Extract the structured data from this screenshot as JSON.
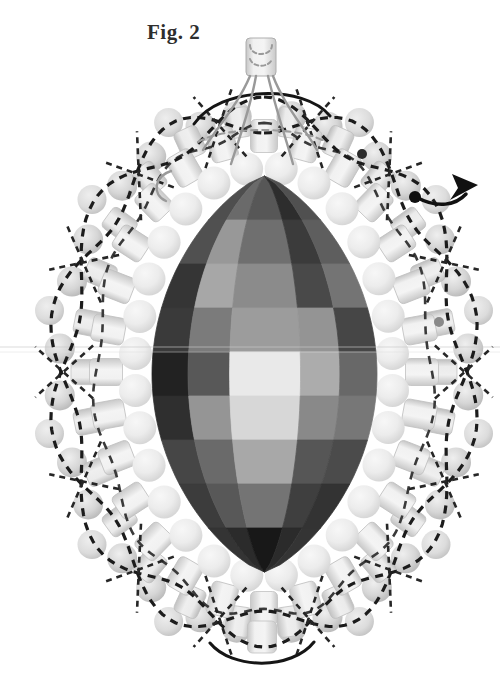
{
  "figure": {
    "label": "Fig. 2"
  },
  "colors": {
    "background": "#ffffff",
    "thread_dark": "#1c1c1c",
    "thread_mid": "#3a3a3a",
    "thread_gray": "#9a9a9a",
    "label_text": "#2e2e2e"
  },
  "diagram": {
    "canvas": {
      "width": 500,
      "height": 678
    },
    "center": {
      "x": 264,
      "y": 372
    },
    "central_bead": {
      "cx": 264.5,
      "cy": 374,
      "rx": 112.5,
      "ry": 198,
      "pointiness": 0.75,
      "col_fractions": [
        -1,
        -0.68,
        -0.31,
        0.32,
        0.67,
        1
      ],
      "row_bounds": [
        176,
        220,
        264,
        308,
        352,
        396,
        440,
        484,
        528,
        572
      ],
      "facet_colors": [
        [
          "#4e4e4e",
          "#6a6a6a",
          "#575757",
          "#2d2d2d",
          "#505050"
        ],
        [
          "#505050",
          "#989898",
          "#6f6f6f",
          "#3b3b3b",
          "#5e5e5e"
        ],
        [
          "#353535",
          "#a7a7a7",
          "#8b8b8b",
          "#494949",
          "#747474"
        ],
        [
          "#3a3a3a",
          "#7b7b7b",
          "#9c9c9c",
          "#949494",
          "#464646"
        ],
        [
          "#222222",
          "#585858",
          "#e9e9e9",
          "#acacac",
          "#686868"
        ],
        [
          "#2f2f2f",
          "#959595",
          "#d7d7d7",
          "#898989",
          "#777777"
        ],
        [
          "#464646",
          "#6a6a6a",
          "#a8a8a8",
          "#565656",
          "#4b4b4b"
        ],
        [
          "#3c3c3c",
          "#585858",
          "#747474",
          "#3f3f3f",
          "#333333"
        ],
        [
          "#343434",
          "#2b2b2b",
          "#181818",
          "#2b2b2b",
          "#343434"
        ]
      ]
    },
    "rings": [
      {
        "name": "picot-bead",
        "type": "round",
        "rx": 205,
        "ry": 258,
        "scale": 1.073,
        "count": 14,
        "phase": 0,
        "r": 14.5,
        "skip": [
          0,
          7
        ],
        "grad": "gradPicot",
        "adjust": 0
      },
      {
        "name": "edge-pair-bead",
        "type": "round-pair",
        "rx": 205,
        "ry": 258,
        "scale": 1.0,
        "count": 14,
        "phase": 12.857,
        "pair_dtheta": 5.2,
        "r": 15,
        "grad": "gradEdge",
        "adjust": 0
      },
      {
        "name": "outer-cylinder-bead",
        "type": "cylinder",
        "rx": 178,
        "ry": 252,
        "scale": 1.0,
        "count": 26,
        "phase": 6.9,
        "w": 25,
        "h": 30,
        "grad": "gradCylB",
        "adjust": 5.7
      },
      {
        "name": "cylinder-bead",
        "type": "cylinder",
        "rx": 158,
        "ry": 236,
        "scale": 1.0,
        "count": 28,
        "phase": 0,
        "w": 27,
        "h": 33,
        "grad": "gradCylA",
        "adjust": 5.7
      },
      {
        "name": "inner-round-bead",
        "type": "round",
        "rx": 129,
        "ry": 205,
        "scale": 1.0,
        "count": 28,
        "phase": 6.4,
        "r": 16.5,
        "grad": "gradInner",
        "adjust": 5.7
      }
    ],
    "extra_beads": [
      {
        "name": "bottom-cylinder-bead",
        "type": "cylinder",
        "x": 262,
        "y": 637,
        "w": 29,
        "h": 32,
        "rot": 0,
        "grad": "gradCylA"
      }
    ],
    "top_bead": {
      "x": 246,
      "y": 38,
      "w": 30,
      "h": 38,
      "rx": 4,
      "grad": "gradCylA",
      "stroke": "#aeaeae"
    },
    "woven_thread": {
      "rx": 203,
      "ry": 257,
      "waves": 7,
      "amp": 0.07,
      "color": "#1c1c1c",
      "width": 3.2,
      "dash": "8 6.5"
    },
    "middle_thread": {
      "rx": 168,
      "ry": 243,
      "waves": 11,
      "amp": 0.025,
      "color": "#3a3a3a",
      "width": 2.6,
      "dash": "8 7"
    },
    "pair_crossings": {
      "s_in": 0.84,
      "s_out": 1.12,
      "dth_in": 7,
      "dth_out": 5,
      "color": "#262626",
      "width": 2.6,
      "dash": "6 5"
    },
    "guide_lines": [
      {
        "y": 347,
        "color": "#c9c9c9",
        "opacity": 0.65
      },
      {
        "y": 352,
        "color": "#e0e0e0",
        "opacity": 0.5
      }
    ],
    "fixed_threads": [
      {
        "name": "top-arc-thread",
        "d": "M 194 124 C 220 86 304 84 330 116",
        "color": "#151515",
        "width": 3,
        "dash": ""
      },
      {
        "name": "top-gray-dashed-thread",
        "d": "M 198 142 C 225 126 299 126 326 142",
        "color": "#9c9c9c",
        "width": 2.2,
        "dash": "6 5"
      },
      {
        "name": "suspension-thread",
        "d": "M 250 76 C 238 105 215 130 203 150",
        "color": "#999999",
        "width": 2.4,
        "dash": ""
      },
      {
        "name": "suspension-thread",
        "d": "M 256 76 C 250 110 238 142 231 164",
        "color": "#999999",
        "width": 2.4,
        "dash": ""
      },
      {
        "name": "suspension-thread",
        "d": "M 268 76 C 276 110 287 142 293 164",
        "color": "#999999",
        "width": 2.4,
        "dash": ""
      },
      {
        "name": "suspension-thread",
        "d": "M 273 76 C 284 105 306 130 317 150",
        "color": "#999999",
        "width": 2.4,
        "dash": ""
      },
      {
        "name": "loop-dashed-thread",
        "d": "M 250 45 C 250 57 272 57 272 45",
        "color": "#9a9a9a",
        "width": 2,
        "dash": "4 3"
      },
      {
        "name": "loop-dashed-thread",
        "d": "M 250 59 C 253 68 269 68 272 59",
        "color": "#9a9a9a",
        "width": 2,
        "dash": "4 3"
      },
      {
        "name": "left-hook-thread",
        "d": "M 171 171 C 155 176 151 194 166 201",
        "color": "#9a9a9a",
        "width": 2.4,
        "dash": ""
      },
      {
        "name": "bottom-arc-thread",
        "d": "M 210 643 C 232 670 292 670 314 642",
        "color": "#151515",
        "width": 3,
        "dash": ""
      },
      {
        "name": "arrow-curve",
        "d": "M 416 197 C 438 209 456 205 466 194",
        "color": "#111111",
        "width": 3.5,
        "dash": ""
      }
    ],
    "arrowhead": {
      "points": "478,185 452,174 458,188 450,200",
      "color": "#111111"
    },
    "dots": [
      {
        "name": "thread-anchor-dot",
        "x": 362,
        "y": 154,
        "r": 5,
        "color": "#2b2b2b"
      },
      {
        "name": "thread-anchor-dot",
        "x": 415,
        "y": 197,
        "r": 6,
        "color": "#101010"
      },
      {
        "name": "thread-anchor-dot",
        "x": 439,
        "y": 322,
        "r": 5,
        "color": "#8a8a8a"
      }
    ]
  }
}
